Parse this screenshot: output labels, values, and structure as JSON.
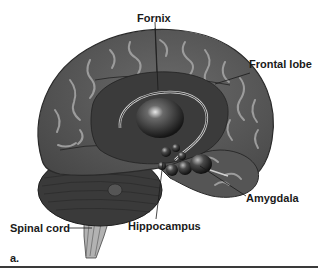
{
  "figure": {
    "panel_label": "a.",
    "labels": {
      "fornix": "Fornix",
      "frontal_lobe": "Frontal lobe",
      "amygdala": "Amygdala",
      "hippocampus": "Hippocampus",
      "spinal_cord": "Spinal cord"
    },
    "colors": {
      "cortex": "#5e5e5e",
      "cortex_dark": "#3c3c3c",
      "gyri_highlight": "#9a9a9a",
      "inner_structures": "#262626",
      "spinal_cord": "#b5b5b5",
      "text": "#1a1a1a",
      "rule": "#3a3a3a"
    }
  }
}
